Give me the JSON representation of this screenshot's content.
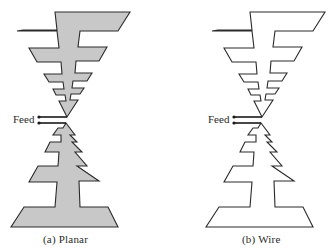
{
  "figure": {
    "panels": [
      {
        "id": "a",
        "caption": "(a)  Planar",
        "feed_label": "Feed",
        "style": "filled",
        "fill_color": "#c8c8c8",
        "stroke_color": "#2a2a2a"
      },
      {
        "id": "b",
        "caption": "(b)  Wire",
        "feed_label": "Feed",
        "style": "outline",
        "fill_color": "none",
        "stroke_color": "#2a2a2a"
      }
    ]
  }
}
